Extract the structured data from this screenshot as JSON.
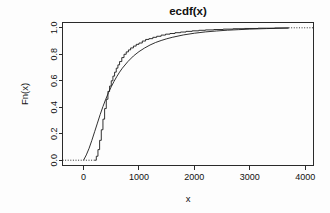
{
  "chart_data": {
    "type": "line",
    "title": "ecdf(x)",
    "xlabel": "x",
    "ylabel": "Fn(x)",
    "xlim": [
      -380,
      4150
    ],
    "ylim": [
      -0.04,
      1.04
    ],
    "grid": false,
    "legend_position": "none",
    "xticks": [
      0,
      1000,
      2000,
      3000,
      4000
    ],
    "xtick_labels": [
      "0",
      "1000",
      "2000",
      "3000",
      "4000"
    ],
    "yticks": [
      0.0,
      0.2,
      0.4,
      0.6,
      0.8,
      1.0
    ],
    "ytick_labels": [
      "0.0",
      "0.2",
      "0.4",
      "0.6",
      "0.8",
      "1.0"
    ],
    "series": [
      {
        "name": "empirical cdf (step)",
        "style": "step",
        "x": [
          200,
          230,
          260,
          290,
          320,
          350,
          380,
          410,
          440,
          470,
          500,
          530,
          560,
          590,
          620,
          650,
          690,
          730,
          770,
          810,
          850,
          900,
          950,
          1000,
          1060,
          1120,
          1180,
          1250,
          1320,
          1400,
          1480,
          1560,
          1650,
          1750,
          1850,
          1960,
          2080,
          2200,
          2350,
          2520,
          2700,
          2900,
          3150,
          3450,
          3700
        ],
        "y": [
          0.0,
          0.03,
          0.08,
          0.15,
          0.23,
          0.31,
          0.39,
          0.46,
          0.52,
          0.56,
          0.6,
          0.635,
          0.665,
          0.695,
          0.72,
          0.745,
          0.775,
          0.8,
          0.818,
          0.833,
          0.848,
          0.862,
          0.875,
          0.885,
          0.9,
          0.912,
          0.918,
          0.928,
          0.936,
          0.945,
          0.952,
          0.957,
          0.963,
          0.968,
          0.973,
          0.977,
          0.981,
          0.984,
          0.987,
          0.99,
          0.993,
          0.995,
          0.997,
          0.999,
          1.0
        ]
      },
      {
        "name": "fitted cdf (smooth)",
        "style": "smooth",
        "x": [
          0,
          50,
          100,
          150,
          200,
          250,
          300,
          350,
          400,
          450,
          500,
          550,
          600,
          650,
          700,
          800,
          900,
          1000,
          1100,
          1200,
          1300,
          1400,
          1500,
          1600,
          1800,
          2000,
          2200,
          2400,
          2600,
          2800,
          3000,
          3300,
          3600,
          3700
        ],
        "y": [
          0.0,
          0.04,
          0.09,
          0.15,
          0.215,
          0.28,
          0.345,
          0.405,
          0.46,
          0.51,
          0.555,
          0.595,
          0.632,
          0.665,
          0.695,
          0.745,
          0.787,
          0.82,
          0.847,
          0.87,
          0.889,
          0.904,
          0.917,
          0.928,
          0.946,
          0.959,
          0.969,
          0.976,
          0.982,
          0.986,
          0.99,
          0.994,
          0.997,
          0.998
        ]
      },
      {
        "name": "lower tail guide",
        "style": "dotted",
        "x": [
          -380,
          200
        ],
        "y": [
          0.0,
          0.0
        ]
      },
      {
        "name": "upper tail guide",
        "style": "dotted",
        "x": [
          3700,
          4150
        ],
        "y": [
          1.0,
          1.0
        ]
      }
    ]
  }
}
